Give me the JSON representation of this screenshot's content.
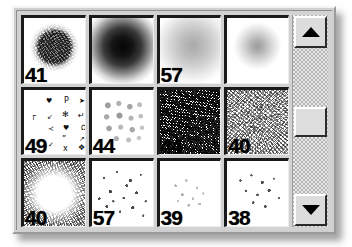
{
  "palette": {
    "title": "Brushes",
    "grid": {
      "columns": 4,
      "rows": 3,
      "cells": [
        {
          "label": "41",
          "style": "b-noise-disc",
          "name": "brush-textured-round-41"
        },
        {
          "label": "",
          "style": "b-soft-dark",
          "name": "brush-soft-round-dark"
        },
        {
          "label": "57",
          "style": "b-soft-mid",
          "name": "brush-soft-round-57"
        },
        {
          "label": "",
          "style": "b-soft-small",
          "name": "brush-soft-round-small"
        },
        {
          "label": "49",
          "style": "b-symbols",
          "name": "brush-assorted-symbols-49"
        },
        {
          "label": "44",
          "style": "b-dotgrid",
          "name": "brush-soft-dot-grid-44"
        },
        {
          "label": "44",
          "style": "b-noise-dense",
          "name": "brush-dense-noise-44"
        },
        {
          "label": "40",
          "style": "b-noise-light",
          "name": "brush-light-noise-40"
        },
        {
          "label": "40",
          "style": "b-noise-edge",
          "name": "brush-edge-noise-40"
        },
        {
          "label": "57",
          "style": "b-speckle-med",
          "name": "brush-speckle-57"
        },
        {
          "label": "39",
          "style": "b-speckle-faint",
          "name": "brush-faint-speckle-39"
        },
        {
          "label": "38",
          "style": "b-speckle-sparse",
          "name": "brush-sparse-speckle-38"
        }
      ]
    },
    "symbol_glyphs": [
      {
        "char": "♥",
        "x": 22,
        "y": 8,
        "size": 7
      },
      {
        "char": "P",
        "x": 40,
        "y": 7,
        "size": 8
      },
      {
        "char": "➤",
        "x": 55,
        "y": 8,
        "size": 7
      },
      {
        "char": "┌",
        "x": 7,
        "y": 22,
        "size": 8
      },
      {
        "char": "↙",
        "x": 23,
        "y": 24,
        "size": 7
      },
      {
        "char": "✻",
        "x": 38,
        "y": 21,
        "size": 8
      },
      {
        "char": "↵",
        "x": 54,
        "y": 22,
        "size": 8
      },
      {
        "char": "≺",
        "x": 24,
        "y": 36,
        "size": 7
      },
      {
        "char": "♥",
        "x": 39,
        "y": 35,
        "size": 7
      },
      {
        "char": "Ω",
        "x": 57,
        "y": 35,
        "size": 7
      },
      {
        "char": "”",
        "x": 38,
        "y": 46,
        "size": 8
      },
      {
        "char": "↗",
        "x": 55,
        "y": 46,
        "size": 7
      },
      {
        "char": "✓",
        "x": 24,
        "y": 52,
        "size": 7
      },
      {
        "char": "x",
        "x": 39,
        "y": 55,
        "size": 8
      },
      {
        "char": "❖",
        "x": 54,
        "y": 54,
        "size": 8
      }
    ],
    "scrollbar": {
      "up_icon": "triangle-up-icon",
      "down_icon": "triangle-down-icon",
      "thumb_position_percent": 45
    },
    "colors": {
      "panel_face": "#cfcfcf",
      "cell_background": "#ffffff",
      "cell_border": "#1a1a1a",
      "label_text": "#000000",
      "scrollbar_track": "#e9e9e9"
    }
  }
}
